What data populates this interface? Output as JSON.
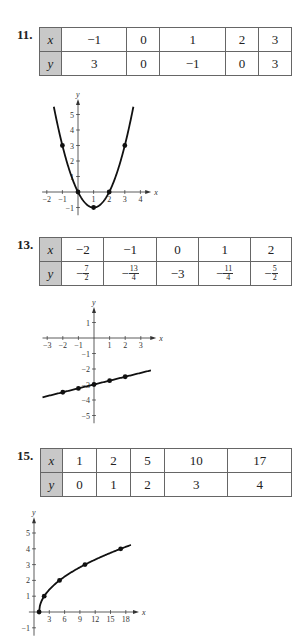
{
  "problems": [
    {
      "number": "11.",
      "table": {
        "x_label": "x",
        "y_label": "y",
        "x": [
          "−1",
          "0",
          "1",
          "2",
          "3"
        ],
        "y": [
          "3",
          "0",
          "−1",
          "0",
          "3"
        ]
      }
    },
    {
      "number": "13.",
      "table": {
        "x_label": "x",
        "y_label": "y",
        "x": [
          "−2",
          "−1",
          "0",
          "1",
          "2"
        ],
        "y": [
          {
            "sign": "−",
            "num": "7",
            "den": "2"
          },
          {
            "sign": "−",
            "num": "13",
            "den": "4"
          },
          {
            "plain": "−3"
          },
          {
            "sign": "−",
            "num": "11",
            "den": "4"
          },
          {
            "sign": "−",
            "num": "5",
            "den": "2"
          }
        ]
      }
    },
    {
      "number": "15.",
      "table": {
        "x_label": "x",
        "y_label": "y",
        "x": [
          "1",
          "2",
          "5",
          "10",
          "17"
        ],
        "y": [
          "0",
          "1",
          "2",
          "3",
          "4"
        ]
      }
    }
  ],
  "chart_data": [
    {
      "type": "line",
      "title": "",
      "xlabel": "x",
      "ylabel": "y",
      "x_ticks": [
        -2,
        -1,
        1,
        2,
        3,
        4
      ],
      "y_ticks": [
        -1,
        1,
        2,
        3,
        4,
        5
      ],
      "points": [
        [
          -1,
          3
        ],
        [
          0,
          0
        ],
        [
          1,
          -1
        ],
        [
          2,
          0
        ],
        [
          3,
          3
        ]
      ],
      "curve": "y = x^2 - 2x",
      "xlim": [
        -2.3,
        4.5
      ],
      "ylim": [
        -1.5,
        5.8
      ]
    },
    {
      "type": "line",
      "title": "",
      "xlabel": "x",
      "ylabel": "y",
      "x_ticks": [
        -3,
        -2,
        -1,
        1,
        2,
        3
      ],
      "y_ticks": [
        -5,
        -4,
        -3,
        -2,
        -1,
        1
      ],
      "points": [
        [
          -2,
          -3.5
        ],
        [
          -1,
          -3.25
        ],
        [
          0,
          -3
        ],
        [
          1,
          -2.75
        ],
        [
          2,
          -2.5
        ]
      ],
      "curve": "y = x/4 - 3",
      "xlim": [
        -3.3,
        3.8
      ],
      "ylim": [
        -5.5,
        1.8
      ]
    },
    {
      "type": "line",
      "title": "",
      "xlabel": "x",
      "ylabel": "y",
      "x_ticks": [
        3,
        6,
        9,
        12,
        15,
        18
      ],
      "y_ticks": [
        -1,
        1,
        2,
        3,
        4,
        5
      ],
      "points": [
        [
          1,
          0
        ],
        [
          2,
          1
        ],
        [
          5,
          2
        ],
        [
          10,
          3
        ],
        [
          17,
          4
        ]
      ],
      "curve": "y = sqrt(x - 1)",
      "xlim": [
        -1,
        20
      ],
      "ylim": [
        -1.5,
        5.8
      ]
    }
  ]
}
